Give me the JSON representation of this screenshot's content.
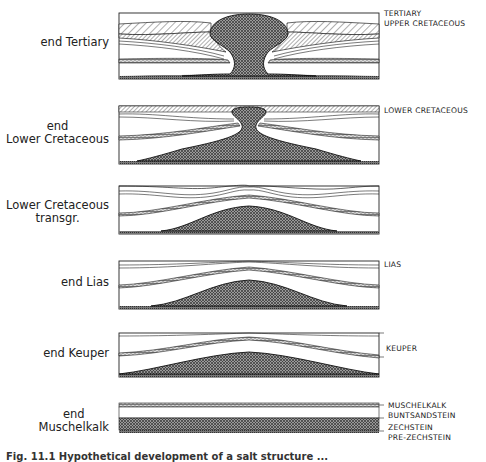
{
  "figure": {
    "caption": "Fig. 11.1  Hypothetical development of a salt structure ...",
    "panels": [
      {
        "id": "end-tertiary",
        "stage_lines": [
          "end Tertiary"
        ],
        "unit_labels": [
          "TERTIARY",
          "UPPER CRETACEOUS"
        ]
      },
      {
        "id": "end-lower-cretaceous",
        "stage_lines": [
          "end",
          "Lower Cretaceous"
        ],
        "unit_labels": [
          "LOWER CRETACEOUS"
        ]
      },
      {
        "id": "lower-cretaceous-transgr",
        "stage_lines": [
          "Lower Cretaceous",
          "transgr."
        ],
        "unit_labels": []
      },
      {
        "id": "end-lias",
        "stage_lines": [
          "end Lias"
        ],
        "unit_labels": [
          "LIAS"
        ]
      },
      {
        "id": "end-keuper",
        "stage_lines": [
          "end Keuper"
        ],
        "unit_labels": [
          "KEUPER"
        ]
      },
      {
        "id": "end-muschelkalk",
        "stage_lines": [
          "end",
          "Muschelkalk"
        ],
        "unit_labels": [
          "MUSCHELKALK",
          "BUNTSANDSTEIN",
          "ZECHSTEIN",
          "PRE-ZECHSTEIN"
        ]
      }
    ]
  },
  "legend_patterns": {
    "salt_zechstein": "cross-hatched dark stipple",
    "cretaceous": "diagonal hatch",
    "muschelkalk": "brick/dash pattern",
    "clastics": "blank white"
  },
  "colors": {
    "ink": "#1a1a1a",
    "paper": "#ffffff",
    "salt_fill": "#6d6d6d"
  }
}
